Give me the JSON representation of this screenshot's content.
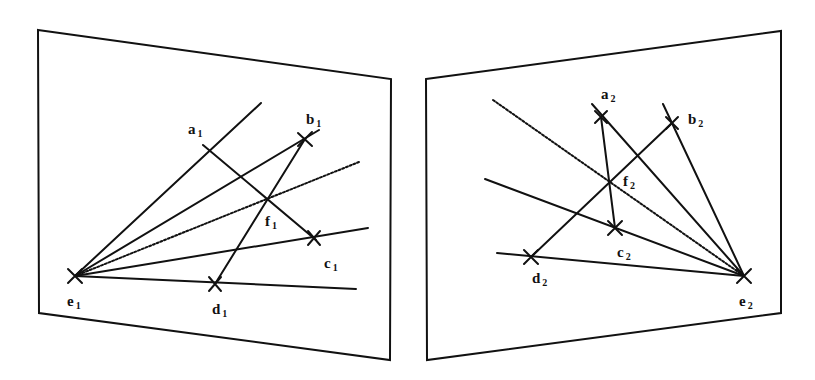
{
  "diagram": {
    "type": "epipolar-geometry-two-views",
    "colors": {
      "line": "#111111",
      "background": "#ffffff"
    },
    "left_view": {
      "frame": [
        [
          38,
          30
        ],
        [
          391,
          79
        ],
        [
          390,
          360
        ],
        [
          39,
          313
        ]
      ],
      "epipole": {
        "name": "e",
        "sub": "1",
        "pos": [
          75,
          276
        ]
      },
      "points": [
        {
          "name": "a",
          "sub": "1",
          "pos": [
            209,
            150
          ],
          "label_pos": [
            188,
            122
          ]
        },
        {
          "name": "b",
          "sub": "1",
          "pos": [
            305,
            139
          ],
          "label_pos": [
            306,
            112
          ]
        },
        {
          "name": "c",
          "sub": "1",
          "pos": [
            314,
            238
          ],
          "label_pos": [
            324,
            256
          ]
        },
        {
          "name": "d",
          "sub": "1",
          "pos": [
            215,
            284
          ],
          "label_pos": [
            212,
            302
          ]
        },
        {
          "name": "f",
          "sub": "1",
          "pos": [
            268,
            199
          ],
          "label_pos": [
            265,
            214
          ]
        },
        {
          "name": "e",
          "sub": "1",
          "pos": [
            75,
            276
          ],
          "label_pos": [
            67,
            294
          ]
        }
      ]
    },
    "right_view": {
      "frame": [
        [
          426,
          79
        ],
        [
          781,
          31
        ],
        [
          781,
          313
        ],
        [
          427,
          360
        ]
      ],
      "epipole": {
        "name": "e",
        "sub": "2",
        "pos": [
          744,
          276
        ]
      },
      "points": [
        {
          "name": "a",
          "sub": "2",
          "pos": [
            601,
            117
          ],
          "label_pos": [
            601,
            87
          ]
        },
        {
          "name": "b",
          "sub": "2",
          "pos": [
            672,
            123
          ],
          "label_pos": [
            688,
            112
          ]
        },
        {
          "name": "c",
          "sub": "2",
          "pos": [
            615,
            228
          ],
          "label_pos": [
            617,
            245
          ]
        },
        {
          "name": "d",
          "sub": "2",
          "pos": [
            531,
            257
          ],
          "label_pos": [
            532,
            271
          ]
        },
        {
          "name": "f",
          "sub": "2",
          "pos": [
            610,
            182
          ],
          "label_pos": [
            623,
            176
          ]
        },
        {
          "name": "e",
          "sub": "2",
          "pos": [
            744,
            276
          ],
          "label_pos": [
            739,
            294
          ]
        }
      ]
    }
  },
  "labels": {
    "a1": "a",
    "a1_sub": "1",
    "b1": "b",
    "b1_sub": "1",
    "c1": "c",
    "c1_sub": "1",
    "d1": "d",
    "d1_sub": "1",
    "e1": "e",
    "e1_sub": "1",
    "f1": "f",
    "f1_sub": "1",
    "a2": "a",
    "a2_sub": "2",
    "b2": "b",
    "b2_sub": "2",
    "c2": "c",
    "c2_sub": "2",
    "d2": "d",
    "d2_sub": "2",
    "e2": "e",
    "e2_sub": "2",
    "f2": "f",
    "f2_sub": "2"
  }
}
